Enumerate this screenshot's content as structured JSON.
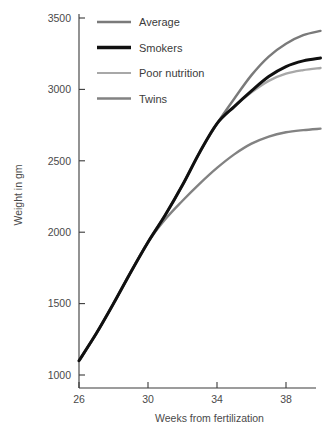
{
  "chart_data": {
    "type": "line",
    "title": "",
    "xlabel": "Weeks from fertilization",
    "ylabel": "Weight in gm",
    "xlim": [
      26,
      40.7
    ],
    "ylim": [
      880,
      3600
    ],
    "xticks": [
      26,
      30,
      34,
      38
    ],
    "xtick_labels": [
      "26",
      "30",
      "34",
      "38"
    ],
    "yticks": [
      1000,
      1500,
      2000,
      2500,
      3000,
      3500
    ],
    "ytick_labels": [
      "1000",
      "1500",
      "2000",
      "2500",
      "3000",
      "3500"
    ],
    "grid": false,
    "legend_position": "top-left-inside",
    "x": [
      26,
      27,
      28,
      29,
      30,
      31,
      32,
      33,
      34,
      35,
      36,
      37,
      38,
      39,
      40
    ],
    "series": [
      {
        "name": "Average",
        "color": "#7a7a7a",
        "width": 2.4,
        "values": [
          1100,
          1290,
          1500,
          1720,
          1930,
          2120,
          2330,
          2560,
          2760,
          2935,
          3100,
          3230,
          3320,
          3380,
          3410
        ]
      },
      {
        "name": "Smokers",
        "color": "#101010",
        "width": 3.0,
        "values": [
          1100,
          1290,
          1500,
          1720,
          1930,
          2120,
          2330,
          2560,
          2760,
          2880,
          2990,
          3090,
          3160,
          3200,
          3220
        ]
      },
      {
        "name": "Poor nutrition",
        "color": "#a8a8a8",
        "width": 2.4,
        "values": [
          1100,
          1290,
          1500,
          1720,
          1930,
          2120,
          2330,
          2560,
          2760,
          2880,
          2980,
          3060,
          3110,
          3135,
          3150
        ]
      },
      {
        "name": "Twins",
        "color": "#828282",
        "width": 2.4,
        "values": [
          1100,
          1290,
          1500,
          1720,
          1930,
          2090,
          2220,
          2340,
          2450,
          2545,
          2620,
          2670,
          2700,
          2715,
          2725
        ]
      }
    ]
  },
  "legend": {
    "items": [
      {
        "label": "Average",
        "color": "#7a7a7a",
        "width": 2.4
      },
      {
        "label": "Smokers",
        "color": "#101010",
        "width": 3.4
      },
      {
        "label": "Poor nutrition",
        "color": "#a8a8a8",
        "width": 2.2
      },
      {
        "label": "Twins",
        "color": "#828282",
        "width": 2.4
      }
    ]
  },
  "axes": {
    "y_title": "Weight in gm",
    "x_title": "Weeks from fertilization"
  }
}
